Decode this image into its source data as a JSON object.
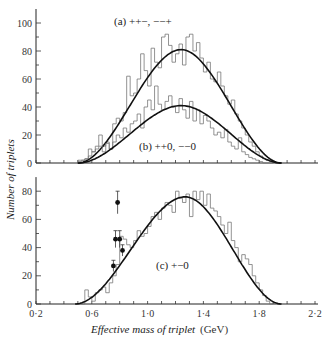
{
  "chart_data": [
    {
      "type": "bar",
      "panel": "top",
      "xlabel": "Effective mass of triplet (GeV)",
      "ylabel": "Number of triplets",
      "xlim": [
        0.2,
        2.2
      ],
      "ylim": [
        0,
        110
      ],
      "yticks": [
        0,
        20,
        40,
        60,
        80,
        100
      ],
      "series": [
        {
          "name": "(a) ++−, −−+",
          "bin_start": 0.5,
          "bin_width": 0.025,
          "values": [
            2,
            2,
            3,
            10,
            8,
            12,
            20,
            12,
            15,
            10,
            28,
            32,
            30,
            36,
            62,
            48,
            50,
            60,
            78,
            66,
            55,
            82,
            72,
            68,
            90,
            92,
            84,
            72,
            78,
            85,
            70,
            90,
            92,
            80,
            86,
            75,
            65,
            72,
            60,
            58,
            65,
            55,
            48,
            42,
            45,
            35,
            30,
            25,
            20,
            15,
            12,
            8,
            5,
            3,
            2,
            1
          ],
          "fit_peak": 81,
          "fit_peak_x": 1.24,
          "fit_range": [
            0.5,
            1.96
          ]
        },
        {
          "name": "(b) ++0, −−0",
          "bin_start": 0.5,
          "bin_width": 0.025,
          "values": [
            1,
            2,
            3,
            5,
            8,
            10,
            12,
            8,
            14,
            10,
            15,
            20,
            18,
            25,
            22,
            28,
            30,
            35,
            25,
            40,
            45,
            38,
            55,
            42,
            38,
            44,
            48,
            40,
            36,
            46,
            38,
            32,
            44,
            30,
            38,
            28,
            34,
            30,
            25,
            20,
            22,
            18,
            24,
            15,
            12,
            10,
            18,
            8,
            6,
            4,
            3,
            2,
            1,
            0,
            0,
            0
          ],
          "fit_peak": 41,
          "fit_peak_x": 1.24,
          "fit_range": [
            0.5,
            1.96
          ]
        }
      ],
      "annotations": [
        "(a) ++−, −−+",
        "(b) ++0, −−0"
      ]
    },
    {
      "type": "bar",
      "panel": "bottom",
      "xlabel": "Effective mass of triplet (GeV)",
      "ylabel": "Number of triplets",
      "xlim": [
        0.2,
        2.2
      ],
      "ylim": [
        0,
        90
      ],
      "xticks": [
        0.2,
        0.6,
        1.0,
        1.4,
        1.8,
        2.2
      ],
      "xtick_labels": [
        "0·2",
        "0·6",
        "1·0",
        "1·4",
        "1·8",
        "2·2"
      ],
      "yticks": [
        0,
        20,
        40,
        60,
        80
      ],
      "series": [
        {
          "name": "(c) +−0",
          "bin_start": 0.5,
          "bin_width": 0.025,
          "values": [
            0,
            0,
            10,
            5,
            2,
            8,
            10,
            12,
            8,
            15,
            20,
            28,
            48,
            46,
            42,
            40,
            45,
            52,
            48,
            50,
            55,
            62,
            65,
            60,
            68,
            72,
            70,
            65,
            80,
            75,
            72,
            78,
            62,
            80,
            74,
            80,
            70,
            78,
            68,
            66,
            62,
            56,
            50,
            58,
            45,
            40,
            30,
            35,
            32,
            28,
            20,
            15,
            10,
            6,
            2,
            0
          ],
          "fit_peak": 76,
          "fit_peak_x": 1.27,
          "fit_range": [
            0.48,
            1.96
          ]
        },
        {
          "name": "data points with error bars",
          "points": [
            {
              "x": 0.755,
              "y": 27,
              "err": 4
            },
            {
              "x": 0.77,
              "y": 46,
              "err": 6
            },
            {
              "x": 0.785,
              "y": 72,
              "err": 8
            },
            {
              "x": 0.8,
              "y": 46,
              "err": 6
            },
            {
              "x": 0.82,
              "y": 38,
              "err": 4
            }
          ]
        }
      ],
      "annotations": [
        "(c) +−0"
      ]
    }
  ],
  "labels": {
    "ylabel": "Number of triplets",
    "xlabel_italic": "Effective mass of triplet",
    "xlabel_unit": " (GeV)",
    "ann_a": "(a)  ++−, −−+",
    "ann_b": "(b)  ++0, −−0",
    "ann_c": "(c)  +−0"
  },
  "top_yticks": [
    "0",
    "20",
    "40",
    "60",
    "80",
    "100"
  ],
  "bottom_yticks": [
    "0",
    "20",
    "40",
    "60",
    "80"
  ],
  "xtick_labels": [
    "0·2",
    "0·6",
    "1·0",
    "1·4",
    "1·8",
    "2·2"
  ]
}
